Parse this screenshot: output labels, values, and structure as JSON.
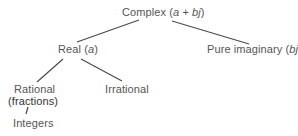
{
  "diagram": {
    "nodes": {
      "complex": {
        "label": "Complex",
        "var_open": "(",
        "var_a": "a",
        "plus": " + ",
        "var_bj": "bj",
        "var_close": ")"
      },
      "real": {
        "label": "Real",
        "var_open": "(",
        "var": "a",
        "var_close": ")"
      },
      "pure_imaginary": {
        "label": "Pure imaginary",
        "var_open": "(",
        "var": "bj",
        "var_close": ")"
      },
      "rational": {
        "label": "Rational",
        "sublabel": "(fractions)"
      },
      "irrational": {
        "label": "Irrational"
      },
      "integers": {
        "label": "Integers"
      }
    },
    "edges": [
      {
        "from": "complex",
        "to": "real"
      },
      {
        "from": "complex",
        "to": "pure_imaginary"
      },
      {
        "from": "real",
        "to": "rational"
      },
      {
        "from": "real",
        "to": "irrational"
      },
      {
        "from": "rational",
        "to": "integers"
      }
    ],
    "edge_color": "#4a4a4a",
    "text_color": "#555555"
  }
}
